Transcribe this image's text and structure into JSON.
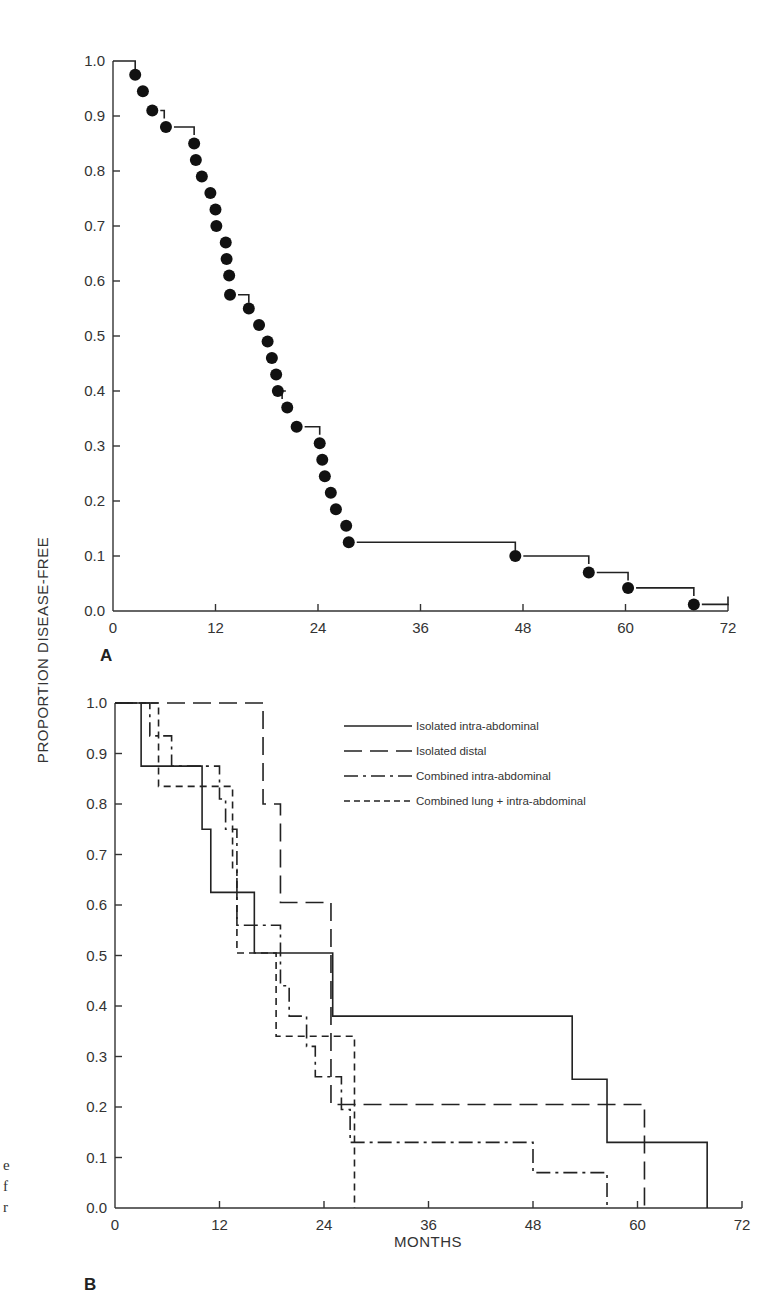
{
  "figure": {
    "y_axis_title": "PROPORTION DISEASE-FREE",
    "x_axis_title": "MONTHS",
    "caption_fragments": [
      "e",
      "f",
      "r"
    ]
  },
  "panels": {
    "A": {
      "letter": "A",
      "y_tick_labels": [
        "1.0",
        "0.9",
        "0.8",
        "0.7",
        "0.6",
        "0.5",
        "0.4",
        "0.3",
        "0.2",
        "0.1",
        "0.0"
      ],
      "x_tick_labels": [
        "0",
        "12",
        "24",
        "36",
        "48",
        "60",
        "72"
      ]
    },
    "B": {
      "letter": "B",
      "y_tick_labels": [
        "1.0",
        "0.9",
        "0.8",
        "0.7",
        "0.6",
        "0.5",
        "0.4",
        "0.3",
        "0.2",
        "0.1",
        "0.0"
      ],
      "x_tick_labels": [
        "0",
        "12",
        "24",
        "36",
        "48",
        "60",
        "72"
      ],
      "legend": [
        {
          "label": "Isolated intra-abdominal",
          "style": "solid"
        },
        {
          "label": "Isolated distal",
          "style": "long-dash"
        },
        {
          "label": "Combined intra-abdominal",
          "style": "dash-dot"
        },
        {
          "label": "Combined lung + intra-abdominal",
          "style": "short-dash"
        }
      ]
    }
  },
  "chart_data": [
    {
      "panel": "A",
      "type": "line",
      "subtype": "kaplan-meier-step",
      "title": "",
      "xlabel": "MONTHS",
      "ylabel": "PROPORTION DISEASE-FREE",
      "xlim": [
        0,
        72
      ],
      "ylim": [
        0.0,
        1.0
      ],
      "x_ticks": [
        0,
        12,
        24,
        36,
        48,
        60,
        72
      ],
      "y_ticks": [
        0.0,
        0.1,
        0.2,
        0.3,
        0.4,
        0.5,
        0.6,
        0.7,
        0.8,
        0.9,
        1.0
      ],
      "grid": false,
      "series": [
        {
          "name": "All patients",
          "marker": "filled-circle",
          "points": [
            {
              "x": 2.6,
              "y": 0.975
            },
            {
              "x": 3.5,
              "y": 0.945
            },
            {
              "x": 4.6,
              "y": 0.91
            },
            {
              "x": 6.2,
              "y": 0.88
            },
            {
              "x": 9.5,
              "y": 0.85
            },
            {
              "x": 9.7,
              "y": 0.82
            },
            {
              "x": 10.4,
              "y": 0.79
            },
            {
              "x": 11.4,
              "y": 0.76
            },
            {
              "x": 12.0,
              "y": 0.73
            },
            {
              "x": 12.1,
              "y": 0.7
            },
            {
              "x": 13.2,
              "y": 0.67
            },
            {
              "x": 13.3,
              "y": 0.64
            },
            {
              "x": 13.6,
              "y": 0.61
            },
            {
              "x": 13.7,
              "y": 0.575
            },
            {
              "x": 15.9,
              "y": 0.55
            },
            {
              "x": 17.1,
              "y": 0.52
            },
            {
              "x": 18.1,
              "y": 0.49
            },
            {
              "x": 18.6,
              "y": 0.46
            },
            {
              "x": 19.1,
              "y": 0.43
            },
            {
              "x": 19.3,
              "y": 0.4
            },
            {
              "x": 20.4,
              "y": 0.37
            },
            {
              "x": 21.5,
              "y": 0.335
            },
            {
              "x": 24.2,
              "y": 0.305
            },
            {
              "x": 24.5,
              "y": 0.275
            },
            {
              "x": 24.8,
              "y": 0.245
            },
            {
              "x": 25.5,
              "y": 0.215
            },
            {
              "x": 26.1,
              "y": 0.185
            },
            {
              "x": 27.3,
              "y": 0.155
            },
            {
              "x": 27.6,
              "y": 0.125
            },
            {
              "x": 47.1,
              "y": 0.1
            },
            {
              "x": 55.7,
              "y": 0.07
            },
            {
              "x": 60.3,
              "y": 0.042
            },
            {
              "x": 68.0,
              "y": 0.012
            }
          ],
          "step_segments": [
            {
              "x0": 0,
              "x1": 2.6,
              "y": 1.0
            },
            {
              "x0": 4.6,
              "x1": 6.0,
              "y": 0.91
            },
            {
              "x0": 6.2,
              "x1": 9.5,
              "y": 0.88
            },
            {
              "x0": 13.7,
              "x1": 15.9,
              "y": 0.575
            },
            {
              "x0": 19.3,
              "x1": 19.8,
              "y": 0.4
            },
            {
              "x0": 21.5,
              "x1": 24.2,
              "y": 0.335
            },
            {
              "x0": 27.6,
              "x1": 47.1,
              "y": 0.125
            },
            {
              "x0": 47.1,
              "x1": 55.7,
              "y": 0.1
            },
            {
              "x0": 55.7,
              "x1": 60.3,
              "y": 0.07
            },
            {
              "x0": 60.3,
              "x1": 68.0,
              "y": 0.042
            },
            {
              "x0": 68.0,
              "x1": 72.0,
              "y": 0.012
            }
          ]
        }
      ]
    },
    {
      "panel": "B",
      "type": "line",
      "subtype": "kaplan-meier-step",
      "title": "",
      "xlabel": "MONTHS",
      "ylabel": "PROPORTION DISEASE-FREE",
      "xlim": [
        0,
        72
      ],
      "ylim": [
        0.0,
        1.0
      ],
      "x_ticks": [
        0,
        12,
        24,
        36,
        48,
        60,
        72
      ],
      "y_ticks": [
        0.0,
        0.1,
        0.2,
        0.3,
        0.4,
        0.5,
        0.6,
        0.7,
        0.8,
        0.9,
        1.0
      ],
      "grid": false,
      "legend_position": "upper right",
      "series": [
        {
          "name": "Isolated intra-abdominal",
          "style": "solid",
          "steps": [
            [
              0,
              1.0
            ],
            [
              3.0,
              0.875
            ],
            [
              10.0,
              0.75
            ],
            [
              11.0,
              0.625
            ],
            [
              16.0,
              0.505
            ],
            [
              25.0,
              0.38
            ],
            [
              52.5,
              0.255
            ],
            [
              56.5,
              0.13
            ],
            [
              68.0,
              0.0
            ]
          ]
        },
        {
          "name": "Isolated distal",
          "style": "long-dash",
          "steps": [
            [
              0,
              1.0
            ],
            [
              17.0,
              0.8
            ],
            [
              19.0,
              0.605
            ],
            [
              24.8,
              0.205
            ],
            [
              60.8,
              0.0
            ]
          ]
        },
        {
          "name": "Combined intra-abdominal",
          "style": "dash-dot",
          "steps": [
            [
              0,
              1.0
            ],
            [
              4.0,
              0.935
            ],
            [
              6.5,
              0.875
            ],
            [
              12.0,
              0.81
            ],
            [
              12.7,
              0.75
            ],
            [
              14.0,
              0.56
            ],
            [
              19.0,
              0.44
            ],
            [
              20.0,
              0.38
            ],
            [
              22.0,
              0.32
            ],
            [
              23.0,
              0.26
            ],
            [
              26.0,
              0.195
            ],
            [
              27.0,
              0.13
            ],
            [
              48.0,
              0.07
            ],
            [
              56.5,
              0.0
            ]
          ]
        },
        {
          "name": "Combined lung + intra-abdominal",
          "style": "short-dash",
          "steps": [
            [
              0,
              1.0
            ],
            [
              5.0,
              0.835
            ],
            [
              13.5,
              0.67
            ],
            [
              14.0,
              0.505
            ],
            [
              18.5,
              0.34
            ],
            [
              27.5,
              0.0
            ]
          ]
        }
      ]
    }
  ]
}
